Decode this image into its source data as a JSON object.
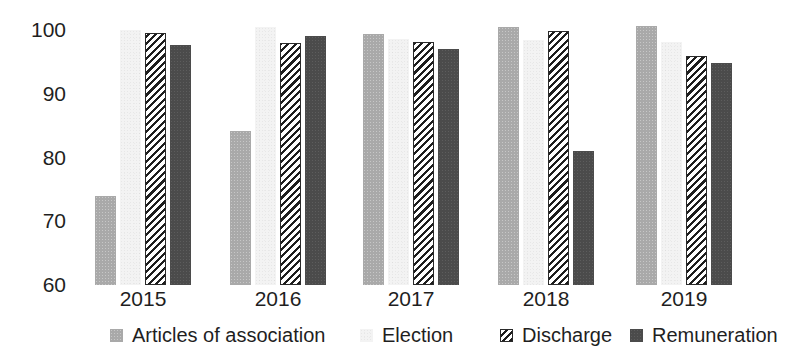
{
  "chart_data": {
    "type": "bar",
    "title": "",
    "subtitle": "",
    "xlabel": "",
    "ylabel": "",
    "categories": [
      "2015",
      "2016",
      "2017",
      "2018",
      "2019"
    ],
    "ylim": [
      60,
      100
    ],
    "yticks": [
      60,
      70,
      80,
      90,
      100
    ],
    "ytick_labels": [
      "60",
      "70",
      "80",
      "90",
      "100"
    ],
    "grid": false,
    "legend_position": "bottom",
    "series": [
      {
        "name": "Articles of association",
        "color": "#a9a9a9",
        "pattern": "solid-noise",
        "values": [
          74.0,
          84.2,
          99.4,
          100.4,
          100.7
        ]
      },
      {
        "name": "Election",
        "color": "#f3f3f3",
        "pattern": "solid-light",
        "values": [
          100.0,
          100.5,
          98.6,
          98.5,
          98.1
        ]
      },
      {
        "name": "Discharge",
        "color": "#ffffff",
        "pattern": "diagonal-hatch",
        "values": [
          99.6,
          98.0,
          98.1,
          99.9,
          95.9
        ]
      },
      {
        "name": "Remuneration",
        "color": "#4b4b4b",
        "pattern": "solid-dark",
        "values": [
          97.6,
          99.0,
          97.1,
          81.0,
          94.9
        ]
      }
    ]
  },
  "legend": {
    "items": [
      {
        "label": "Articles of association",
        "swatch_name": "legend-swatch-articles-of-association"
      },
      {
        "label": "Election",
        "swatch_name": "legend-swatch-election"
      },
      {
        "label": "Discharge",
        "swatch_name": "legend-swatch-discharge"
      },
      {
        "label": "Remuneration",
        "swatch_name": "legend-swatch-remuneration"
      }
    ]
  }
}
